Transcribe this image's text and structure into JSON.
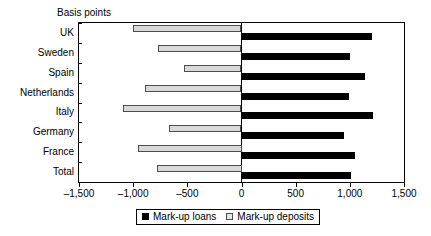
{
  "chart_data": {
    "type": "bar",
    "orientation": "horizontal",
    "title": "",
    "axis_title": "Basis points",
    "xlabel": "",
    "ylabel": "",
    "xlim": [
      -1500,
      1500
    ],
    "grid": false,
    "legend_position": "bottom",
    "categories": [
      "UK",
      "Sweden",
      "Spain",
      "Netherlands",
      "Italy",
      "Germany",
      "France",
      "Total"
    ],
    "xticks": [
      -1500,
      -1000,
      -500,
      0,
      500,
      1000,
      1500
    ],
    "xticklabels": [
      "–1,500",
      "–1,000",
      "–500",
      "0",
      "500",
      "1,000",
      "1,500"
    ],
    "series": [
      {
        "name": "Mark-up loans",
        "color": "#000000",
        "values": [
          1200,
          1000,
          1140,
          990,
          1210,
          950,
          1050,
          1010
        ]
      },
      {
        "name": "Mark-up deposits",
        "color": "#d9d9d9",
        "values": [
          -1000,
          -770,
          -530,
          -890,
          -1090,
          -670,
          -960,
          -780
        ]
      }
    ]
  },
  "legend": {
    "items": [
      {
        "label": "Mark-up loans",
        "swatch": "filled-black-square"
      },
      {
        "label": "Mark-up deposits",
        "swatch": "outlined-light-square"
      }
    ]
  }
}
